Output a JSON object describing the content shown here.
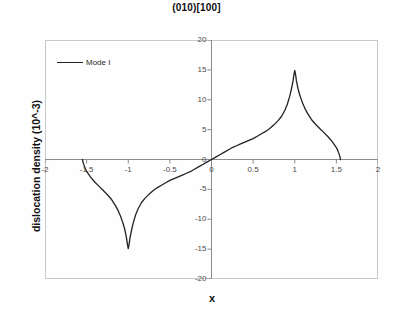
{
  "chart_data": {
    "type": "line",
    "title": "(010)[100]",
    "xlabel": "x",
    "ylabel": "dislocation density (10^-3)",
    "xlim": [
      -2,
      2
    ],
    "ylim": [
      -20,
      20
    ],
    "xticks": [
      "-2",
      "-1.5",
      "-1",
      "-0.5",
      "0",
      "0.5",
      "1",
      "1.5",
      "2"
    ],
    "xtick_values": [
      -2,
      -1.5,
      -1,
      -0.5,
      0,
      0.5,
      1,
      1.5,
      2
    ],
    "yticks": [
      "20",
      "15",
      "10",
      "5",
      "0",
      "-5",
      "-10",
      "-15",
      "-20"
    ],
    "ytick_values": [
      20,
      15,
      10,
      5,
      0,
      -5,
      -10,
      -15,
      -20
    ],
    "grid": false,
    "legend_position": "top-left",
    "line_color": "#222222",
    "axis_color": "#8c8c8c",
    "border_color": "#c9c9c9",
    "series": [
      {
        "name": "Mode I",
        "color": "#222222",
        "x": [
          -1.55,
          -1.54,
          -1.52,
          -1.5,
          -1.45,
          -1.4,
          -1.35,
          -1.3,
          -1.25,
          -1.2,
          -1.15,
          -1.12,
          -1.09,
          -1.06,
          -1.04,
          -1.02,
          -1.01,
          -1.0,
          -0.99,
          -0.98,
          -0.96,
          -0.94,
          -0.91,
          -0.88,
          -0.84,
          -0.8,
          -0.75,
          -0.7,
          -0.65,
          -0.6,
          -0.55,
          -0.5,
          -0.45,
          -0.4,
          -0.35,
          -0.3,
          -0.25,
          -0.2,
          -0.15,
          -0.1,
          -0.05,
          0.0,
          0.05,
          0.1,
          0.15,
          0.2,
          0.25,
          0.3,
          0.35,
          0.4,
          0.45,
          0.5,
          0.55,
          0.6,
          0.65,
          0.7,
          0.75,
          0.8,
          0.84,
          0.88,
          0.91,
          0.94,
          0.96,
          0.98,
          0.99,
          1.0,
          1.01,
          1.02,
          1.04,
          1.06,
          1.09,
          1.12,
          1.15,
          1.2,
          1.25,
          1.3,
          1.35,
          1.4,
          1.45,
          1.5,
          1.52,
          1.54,
          1.55
        ],
        "y": [
          0.0,
          -0.6,
          -1.4,
          -2.0,
          -3.0,
          -3.8,
          -4.5,
          -5.2,
          -5.9,
          -6.7,
          -7.8,
          -8.6,
          -9.6,
          -10.8,
          -11.8,
          -13.2,
          -14.2,
          -14.9,
          -14.2,
          -13.2,
          -11.8,
          -10.6,
          -9.2,
          -8.2,
          -7.2,
          -6.5,
          -5.8,
          -5.2,
          -4.7,
          -4.3,
          -3.9,
          -3.5,
          -3.2,
          -2.9,
          -2.6,
          -2.3,
          -2.0,
          -1.6,
          -1.2,
          -0.8,
          -0.4,
          0.0,
          0.4,
          0.8,
          1.2,
          1.6,
          2.0,
          2.3,
          2.6,
          2.9,
          3.2,
          3.5,
          3.9,
          4.3,
          4.7,
          5.2,
          5.8,
          6.5,
          7.2,
          8.2,
          9.2,
          10.6,
          11.8,
          13.2,
          14.2,
          14.9,
          14.2,
          13.2,
          11.8,
          10.8,
          9.6,
          8.6,
          7.8,
          6.7,
          5.9,
          5.2,
          4.5,
          3.8,
          3.0,
          2.0,
          1.4,
          0.6,
          0.0
        ],
        "annotations": {
          "positive_peak": {
            "x": 1.0,
            "y": 15
          },
          "negative_peak": {
            "x": -1.0,
            "y": -15
          },
          "zero_crossings": [
            -1.55,
            0.0,
            1.55
          ]
        }
      }
    ]
  },
  "legend": {
    "entries": [
      {
        "label": "Mode I",
        "color": "#222222"
      }
    ]
  }
}
